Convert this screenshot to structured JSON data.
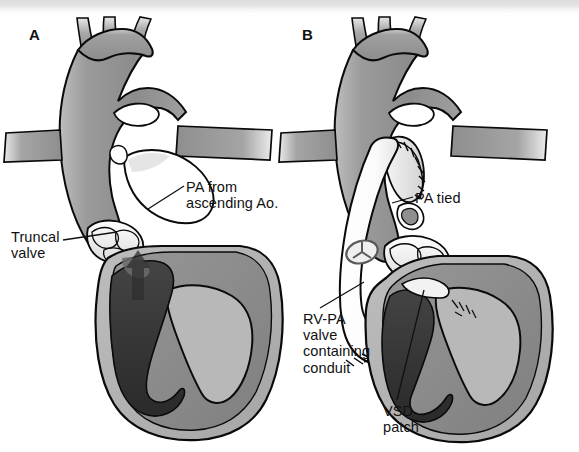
{
  "figure": {
    "background_color": "#ffffff",
    "width": 579,
    "height": 452,
    "scan_band_color": "#dcdcdc"
  },
  "palette": {
    "outline": "#0a0a0a",
    "great_vessel_gray": "#8f8f8f",
    "great_vessel_gray_light": "#a8a8a8",
    "myocardium_gray": "#b2b2b2",
    "septum_gray": "#8a8a8a",
    "chamber_dark": "#3a3a3a",
    "chamber_darker": "#2b2b2b",
    "conduit_white": "#fdfdfd",
    "valve_white": "#f0f0f0",
    "leader_line": "#111111"
  },
  "panels": [
    {
      "id": "A",
      "letter": "A",
      "description": "Truncus arteriosus before repair: single truncal vessel with pulmonary artery arising from ascending aorta, truncal valve, and ventricular septal defect.",
      "callouts": [
        {
          "name": "pa-from-ascending-ao",
          "text": "PA from\nascending Ao.",
          "lines": [
            "PA from",
            "ascending Ao."
          ]
        },
        {
          "name": "truncal-valve",
          "text": "Truncal\nvalve",
          "lines": [
            "Truncal",
            "valve"
          ]
        }
      ]
    },
    {
      "id": "B",
      "letter": "B",
      "description": "After repair: pulmonary artery detached and oversewn, VSD closed with patch, and a valved conduit placed from right ventricle to pulmonary artery.",
      "callouts": [
        {
          "name": "pa-tied",
          "text": "PA tied",
          "lines": [
            "PA tied"
          ]
        },
        {
          "name": "rv-pa-valve-containing-conduit",
          "text": "RV-PA\nvalve\ncontaining\nconduit",
          "lines": [
            "RV-PA",
            "valve",
            "containing",
            "conduit"
          ]
        },
        {
          "name": "vsd-patch",
          "text": "VSD\npatch",
          "lines": [
            "VSD",
            "patch"
          ]
        }
      ]
    }
  ],
  "anatomy_features": [
    "aortic arch with three brachiocephalic branch vessels",
    "ascending aorta / common arterial trunk",
    "pulmonary artery origin",
    "truncal valve cusps",
    "right ventricle",
    "left ventricle",
    "interventricular septum",
    "ventricular septal defect",
    "suture line",
    "trileaflet conduit valve marker"
  ]
}
